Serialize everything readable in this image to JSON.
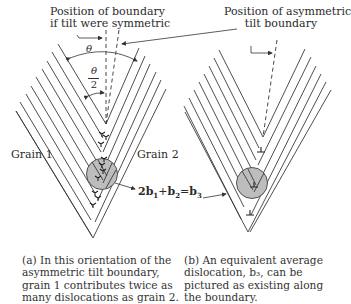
{
  "labels": {
    "symmetric_boundary": [
      "Position of boundary",
      "if tilt were symmetric"
    ],
    "asymmetric_boundary": [
      "Position of asymmetric",
      "tilt boundary"
    ],
    "theta": "θ",
    "half_theta_num": "θ",
    "half_theta_den": "2",
    "grain1": "Grain 1",
    "grain2": "Grain 2",
    "equation": {
      "b1_coef": "2",
      "b1": "b",
      "b1_sub": "1",
      "plus": "+",
      "b2": "b",
      "b2_sub": "2",
      "equals": "=",
      "b3": "b",
      "b3_sub": "3"
    }
  },
  "captions": {
    "a": [
      "(a)  In this orientation of the",
      "asymmetric tilt boundary,",
      "grain 1 contributes twice as",
      "many dislocations as grain 2."
    ],
    "b": [
      "(b)  An equivalent average",
      "dislocation, b₃, can be",
      "pictured as existing along",
      "the boundary."
    ]
  },
  "colors": {
    "line": "#3a3a3a",
    "circle_fill": "#bdbdbd",
    "background": "#ffffff"
  }
}
